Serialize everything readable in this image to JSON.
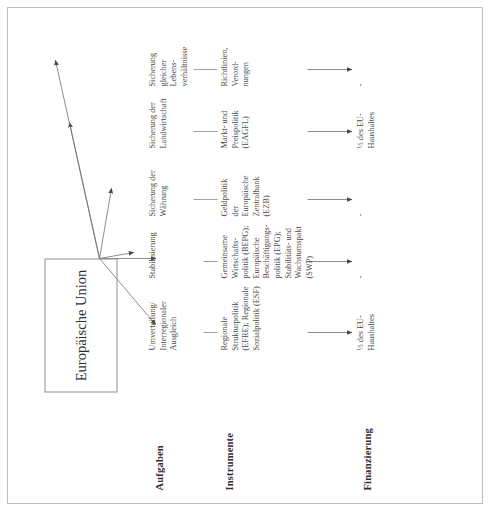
{
  "diagram": {
    "center_node": "Europäische Union",
    "row_labels": {
      "aufgaben": "Aufgaben",
      "instrumente": "Instrumente",
      "finanzierung": "Finanzierung"
    },
    "columns": [
      {
        "task": "Umverteilung/\nInterregionaler Ausgleich",
        "instrument": "Regionale\nStrukturpolitik\n(EFRE); Regionale\nSozialpolitik (ESF)",
        "financing": "½ des EU-\nHaushaltes"
      },
      {
        "task": "Stabilisierung",
        "instrument": "Gemeinsame\nWirtschafts-\npolitik (BEPG);\nEuropäische\nBeschäftigungs-\npolitik (EPG);\nStabilitäts- und\nWachstumspakt\n(SWP)",
        "financing": "-"
      },
      {
        "task": "Sicherung der\nWährung",
        "instrument": "Geldpolitik\nder\nEuropäische\nZentralbank\n(EZB)",
        "financing": "-"
      },
      {
        "task": "Sicherung der\nLandwirtschaft",
        "instrument": "Markt- und\nPreispolitik\n(EAGFL)",
        "financing": "½ des EU-\nHaushaltes"
      },
      {
        "task": "Sicherung\ngleicher\nLebens-\nverhältnisse",
        "instrument": "Richtlinien,\nVerord-\nnungen",
        "financing": "-"
      },
      {
        "task": "Gemeinsame\nAußen- und\nSicherheits-\npolitik",
        "instrument": "Intergouver-\nnementale\nZusammen-\narbeit;\n'Hoher\nvertreter des\nGASP'",
        "financing": "-"
      }
    ],
    "colors": {
      "ink": "#4a4a4a",
      "rule": "#8f8f8f",
      "frame": "#bdbdbd",
      "page": "#ffffff"
    }
  }
}
